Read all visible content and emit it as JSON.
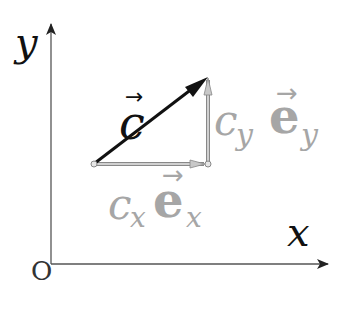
{
  "diagram": {
    "type": "vector-decomposition",
    "origin_label": "O",
    "x_axis_label": "x",
    "y_axis_label": "y",
    "vector": {
      "name": "c",
      "arrow": "→",
      "color": "#111111"
    },
    "x_component": {
      "coefficient": "c",
      "coefficient_sub": "x",
      "basis": "e",
      "basis_sub": "x",
      "arrow": "→",
      "color": "#a8a8a8"
    },
    "y_component": {
      "coefficient": "c",
      "coefficient_sub": "y",
      "basis": "e",
      "basis_sub": "y",
      "arrow": "→",
      "color": "#a8a8a8"
    },
    "colors": {
      "axis": "#555555",
      "vector": "#111111",
      "components": "#a8a8a8",
      "component_labels": "#a6a6a6"
    }
  }
}
